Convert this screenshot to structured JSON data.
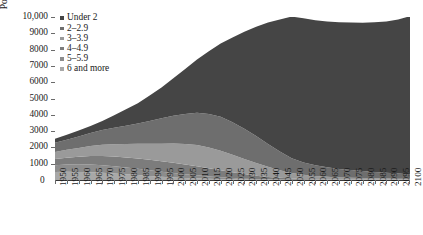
{
  "axes": {
    "y_title": "Population in millions",
    "y_ticks": [
      "10,000",
      "9000",
      "8000",
      "7000",
      "6000",
      "5000",
      "4000",
      "3000",
      "2000",
      "1000"
    ],
    "y_zero": "0",
    "x_ticks": [
      "1950",
      "1955",
      "1960",
      "1965",
      "1970",
      "1975",
      "1980",
      "1985",
      "1990",
      "1995",
      "2000",
      "2005",
      "2010",
      "2015",
      "2020",
      "2025",
      "2030",
      "2035",
      "2040",
      "2045",
      "2050",
      "2055",
      "2060",
      "2065",
      "2070",
      "2075",
      "2080",
      "2085",
      "2090",
      "2095",
      "2100"
    ]
  },
  "legend": {
    "items": [
      {
        "label": "Under 2",
        "color": "#454545"
      },
      {
        "label": "2–2.9",
        "color": "#6e6e6e"
      },
      {
        "label": "3–3.9",
        "color": "#9a9a9a"
      },
      {
        "label": "4–4.9",
        "color": "#7c7c7c"
      },
      {
        "label": "5–5.9",
        "color": "#8c8c8c"
      },
      {
        "label": "6 and more",
        "color": "#a8a8a8"
      }
    ]
  },
  "chart_data": {
    "type": "area",
    "stacked": true,
    "title": "",
    "xlabel": "",
    "ylabel": "Population in millions",
    "ylim": [
      0,
      10000
    ],
    "xlim": [
      "1950",
      "2100"
    ],
    "grid": false,
    "legend_position": "top-left",
    "x": [
      "1950",
      "1955",
      "1960",
      "1965",
      "1970",
      "1975",
      "1980",
      "1985",
      "1990",
      "1995",
      "2000",
      "2005",
      "2010",
      "2015",
      "2020",
      "2025",
      "2030",
      "2035",
      "2040",
      "2045",
      "2050",
      "2055",
      "2060",
      "2065",
      "2070",
      "2075",
      "2080",
      "2085",
      "2090",
      "2095",
      "2100"
    ],
    "series": [
      {
        "name": "Under 2",
        "values": [
          250,
          300,
          360,
          430,
          560,
          780,
          1010,
          1240,
          1560,
          1880,
          2300,
          2760,
          3260,
          3850,
          4500,
          5200,
          5950,
          6700,
          7450,
          8100,
          8700,
          8850,
          8900,
          8950,
          9000,
          9050,
          9100,
          9180,
          9280,
          9450,
          9700
        ]
      },
      {
        "name": "2–2.9",
        "values": [
          560,
          620,
          700,
          800,
          900,
          1000,
          1120,
          1250,
          1400,
          1560,
          1700,
          1850,
          1980,
          2050,
          2080,
          2000,
          1850,
          1650,
          1400,
          1150,
          900,
          750,
          650,
          580,
          520,
          470,
          430,
          390,
          350,
          310,
          280
        ]
      },
      {
        "name": "3–3.9",
        "values": [
          430,
          480,
          540,
          610,
          690,
          760,
          830,
          900,
          980,
          1080,
          1180,
          1250,
          1300,
          1280,
          1200,
          1080,
          930,
          780,
          620,
          470,
          340,
          260,
          200,
          160,
          130,
          110,
          95,
          85,
          75,
          68,
          60
        ]
      },
      {
        "name": "4–4.9",
        "values": [
          380,
          420,
          470,
          520,
          560,
          590,
          610,
          630,
          640,
          640,
          630,
          600,
          560,
          500,
          430,
          350,
          280,
          210,
          150,
          105,
          70,
          50,
          38,
          30,
          24,
          20,
          17,
          15,
          13,
          11,
          10
        ]
      },
      {
        "name": "5–5.9",
        "values": [
          420,
          450,
          470,
          480,
          470,
          450,
          420,
          390,
          350,
          310,
          270,
          230,
          190,
          150,
          115,
          85,
          60,
          42,
          28,
          19,
          12,
          9,
          7,
          5,
          4,
          4,
          3,
          3,
          3,
          2,
          2
        ]
      },
      {
        "name": "6 and more",
        "values": [
          490,
          500,
          490,
          470,
          440,
          400,
          350,
          300,
          250,
          200,
          160,
          125,
          95,
          70,
          50,
          35,
          24,
          16,
          11,
          7,
          5,
          4,
          3,
          2,
          2,
          2,
          1,
          1,
          1,
          1,
          1
        ]
      }
    ]
  }
}
